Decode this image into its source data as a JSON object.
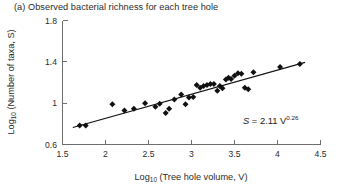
{
  "panel": {
    "label": "(a)",
    "title": "(a) Observed bacterial richness for each tree hole"
  },
  "annotation": {
    "equation_lhs": "S",
    "equation_mid": " = 2.11 V",
    "equation_exponent": "0.26",
    "equation_full": "S = 2.11 V0.26"
  },
  "axis_text": {
    "y_prefix": "Log",
    "y_sub": "10",
    "y_rest": " (Number of taxa, S)",
    "x_prefix": "Log",
    "x_sub": "10",
    "x_rest": " (Tree hole volume, V)"
  },
  "chart_data": {
    "type": "scatter",
    "title": "(a) Observed bacterial richness for each tree hole",
    "xlabel": "Log10 (Tree hole volume, V)",
    "ylabel": "Log10 (Number of taxa, S)",
    "xlim": [
      1.5,
      4.5
    ],
    "ylim": [
      0.6,
      1.8
    ],
    "xticks": [
      1.5,
      2,
      2.5,
      3,
      3.5,
      4,
      4.5
    ],
    "xtick_labels": [
      "1.5",
      "2",
      "2.5",
      "3",
      "3.5",
      "4",
      "4.5"
    ],
    "yticks": [
      0.6,
      1.0,
      1.4,
      1.8
    ],
    "ytick_labels": [
      "0.6",
      "1",
      "1.4",
      "1.8"
    ],
    "grid": false,
    "legend": false,
    "marker": "diamond",
    "marker_color": "#111111",
    "annotations": [
      {
        "text": "S = 2.11 V^0.26",
        "x": 3.72,
        "y": 0.84
      }
    ],
    "fit_line": {
      "label": "power-law fit",
      "color": "#111111",
      "x": [
        1.62,
        4.32
      ],
      "y": [
        0.765,
        1.395
      ]
    },
    "series": [
      {
        "name": "tree holes",
        "x": [
          1.7,
          1.77,
          2.08,
          2.22,
          2.33,
          2.46,
          2.58,
          2.63,
          2.7,
          2.74,
          2.8,
          2.88,
          2.93,
          2.97,
          3.02,
          3.06,
          3.1,
          3.14,
          3.18,
          3.22,
          3.26,
          3.3,
          3.33,
          3.36,
          3.4,
          3.43,
          3.46,
          3.5,
          3.54,
          3.58,
          3.62,
          3.66,
          3.72,
          4.03,
          4.26
        ],
        "y": [
          0.785,
          0.785,
          0.99,
          0.93,
          0.945,
          1.0,
          0.965,
          0.995,
          0.905,
          0.945,
          1.035,
          1.085,
          0.99,
          1.055,
          1.06,
          1.175,
          1.15,
          1.165,
          1.175,
          1.185,
          1.185,
          1.12,
          1.165,
          1.145,
          1.23,
          1.245,
          1.235,
          1.265,
          1.29,
          1.285,
          1.15,
          1.135,
          1.3,
          1.35,
          1.38
        ]
      }
    ]
  }
}
